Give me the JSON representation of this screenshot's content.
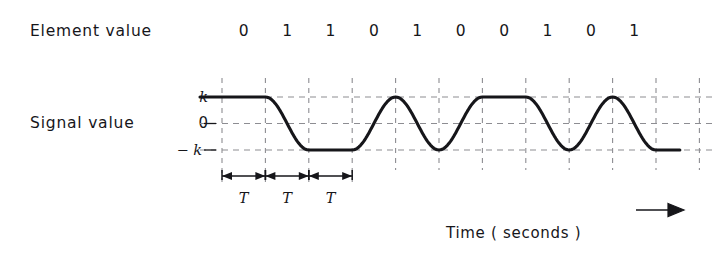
{
  "figure": {
    "element_value_label": "Element  value",
    "signal_value_label": "Signal  value",
    "time_caption": "Time   ( seconds )",
    "axis_ticks": {
      "top": "k",
      "middle": "0",
      "bottom": "− k"
    },
    "period_labels": [
      "T",
      "T",
      "T"
    ],
    "line_color": "#16161a",
    "grid_color": "#8d8d92",
    "background": "#ffffff"
  },
  "chart_data": {
    "type": "line",
    "title": "",
    "xlabel": "Time   ( seconds )",
    "ylabel": "Signal  value",
    "categories": [
      "0",
      "1",
      "1",
      "0",
      "1",
      "0",
      "0",
      "1",
      "0",
      "1"
    ],
    "series": [
      {
        "name": "Element value",
        "values": [
          0,
          1,
          1,
          0,
          1,
          0,
          0,
          1,
          0,
          1
        ]
      },
      {
        "name": "Signal value",
        "values": [
          1,
          -1,
          -1,
          1,
          -1,
          1,
          1,
          -1,
          1,
          -1
        ]
      }
    ],
    "y_tick_labels": [
      "k",
      "0",
      "− k"
    ],
    "y_tick_values": [
      1,
      0,
      -1
    ],
    "ylim": [
      -1,
      1
    ],
    "grid": true,
    "legend": "none",
    "annotations": [
      "T",
      "T",
      "T"
    ],
    "note": "Raised-cosine smoothed binary signal: element 0 maps to +k, element 1 maps to −k; one bit period T per grid interval."
  }
}
